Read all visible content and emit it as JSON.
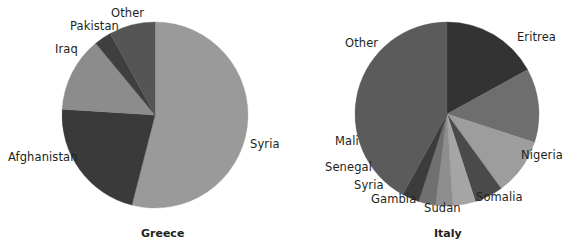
{
  "figure": {
    "background": "#ffffff",
    "label_color": "#231f20"
  },
  "chart_data": [
    {
      "type": "pie",
      "title": "Greece",
      "xlabel": "",
      "ylabel": "",
      "legend": "none",
      "grid": false,
      "start_angle_deg": 90,
      "direction": "clockwise",
      "center": [
        155,
        115
      ],
      "radius": 93,
      "categories": [
        "Syria",
        "Afghanistan",
        "Iraq",
        "Pakistan",
        "Other"
      ],
      "values": [
        54,
        22,
        13,
        3,
        8
      ],
      "colors": [
        "#9a9a9a",
        "#3a3a3a",
        "#8c8c8c",
        "#3f3f3f",
        "#555555"
      ],
      "labels_outside": true
    },
    {
      "type": "pie",
      "title": "Italy",
      "xlabel": "",
      "ylabel": "",
      "legend": "none",
      "grid": false,
      "start_angle_deg": 90,
      "direction": "clockwise",
      "center": [
        447,
        114
      ],
      "radius": 92,
      "categories": [
        "Eritrea",
        "Nigeria",
        "Somalia",
        "Sudan",
        "Gambia",
        "Syria",
        "Senegal",
        "Mali",
        "Other"
      ],
      "values": [
        17,
        13,
        10,
        5,
        4,
        3,
        3,
        3,
        42
      ],
      "colors": [
        "#333333",
        "#6e6e6e",
        "#9d9d9d",
        "#4a4a4a",
        "#a5a5a5",
        "#8e8e8e",
        "#707070",
        "#3c3c3c",
        "#5b5b5b"
      ],
      "labels_outside": true
    }
  ],
  "greece": {
    "title": "Greece",
    "labels": {
      "syria": "Syria",
      "afghanistan": "Afghanistan",
      "iraq": "Iraq",
      "pakistan": "Pakistan",
      "other": "Other"
    }
  },
  "italy": {
    "title": "Italy",
    "labels": {
      "eritrea": "Eritrea",
      "nigeria": "Nigeria",
      "somalia": "Somalia",
      "sudan": "Sudan",
      "gambia": "Gambia",
      "syria": "Syria",
      "senegal": "Senegal",
      "mali": "Mali",
      "other": "Other"
    }
  }
}
